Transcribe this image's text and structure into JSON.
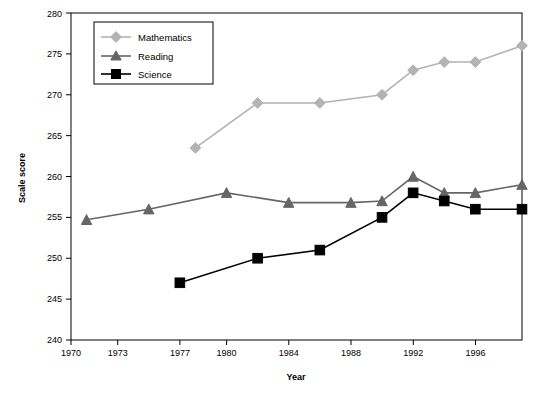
{
  "chart_data": {
    "type": "line",
    "title": "",
    "xlabel": "Year",
    "ylabel": "Scale score",
    "xlim": [
      1970,
      1999
    ],
    "ylim": [
      240,
      280
    ],
    "xticks": [
      1970,
      1973,
      1977,
      1980,
      1984,
      1988,
      1992,
      1996
    ],
    "yticks": [
      240,
      245,
      250,
      255,
      260,
      265,
      270,
      275,
      280
    ],
    "grid": false,
    "legend_position": "top-left",
    "series": [
      {
        "name": "Mathematics",
        "color": "#b3b3b3",
        "marker": "diamond",
        "points": [
          {
            "x": 1978,
            "y": 263.5
          },
          {
            "x": 1982,
            "y": 269
          },
          {
            "x": 1986,
            "y": 269
          },
          {
            "x": 1990,
            "y": 270
          },
          {
            "x": 1992,
            "y": 273
          },
          {
            "x": 1994,
            "y": 274
          },
          {
            "x": 1996,
            "y": 274
          },
          {
            "x": 1999,
            "y": 276
          }
        ]
      },
      {
        "name": "Reading",
        "color": "#666666",
        "marker": "triangle",
        "points": [
          {
            "x": 1971,
            "y": 254.7
          },
          {
            "x": 1975,
            "y": 256
          },
          {
            "x": 1980,
            "y": 258
          },
          {
            "x": 1984,
            "y": 256.8
          },
          {
            "x": 1988,
            "y": 256.8
          },
          {
            "x": 1990,
            "y": 257
          },
          {
            "x": 1992,
            "y": 260
          },
          {
            "x": 1994,
            "y": 258
          },
          {
            "x": 1996,
            "y": 258
          },
          {
            "x": 1999,
            "y": 259
          }
        ]
      },
      {
        "name": "Science",
        "color": "#000000",
        "marker": "square",
        "points": [
          {
            "x": 1977,
            "y": 247
          },
          {
            "x": 1982,
            "y": 250
          },
          {
            "x": 1986,
            "y": 251
          },
          {
            "x": 1990,
            "y": 255
          },
          {
            "x": 1992,
            "y": 258
          },
          {
            "x": 1994,
            "y": 257
          },
          {
            "x": 1996,
            "y": 256
          },
          {
            "x": 1999,
            "y": 256
          }
        ]
      }
    ]
  },
  "labels": {
    "y_axis_title": "Scale score",
    "x_axis_title": "Year",
    "yticks": [
      "240",
      "245",
      "250",
      "255",
      "260",
      "265",
      "270",
      "275",
      "280"
    ],
    "xticks": [
      "1970",
      "1973",
      "1977",
      "1980",
      "1984",
      "1988",
      "1992",
      "1996"
    ],
    "legend": [
      "Mathematics",
      "Reading",
      "Science"
    ]
  }
}
